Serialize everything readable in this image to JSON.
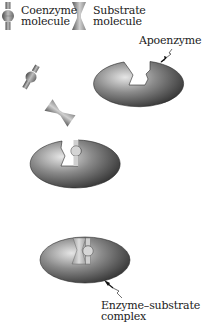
{
  "legend": {
    "coenzyme": {
      "line1": "Coenzyme",
      "line2": "molecule",
      "icon": "coenzyme-molecule-icon"
    },
    "substrate": {
      "line1": "Substrate",
      "line2": "molecule",
      "icon": "substrate-molecule-icon"
    }
  },
  "labels": {
    "apoenzyme": "Apoenzyme",
    "complex_line1": "Enzyme–substrate",
    "complex_line2": "complex"
  },
  "colors": {
    "enzyme_dark": "#3a3a3a",
    "enzyme_light": "#d8d8d8",
    "molecule_dark": "#555555",
    "molecule_light": "#cfcfcf",
    "background": "#ffffff"
  }
}
